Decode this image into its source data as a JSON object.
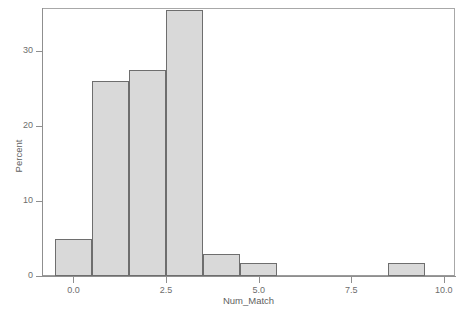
{
  "chart_data": {
    "type": "bar",
    "title": "",
    "xlabel": "Num_Match",
    "ylabel": "Percent",
    "categories": [
      "0",
      "1",
      "2",
      "3",
      "4",
      "5",
      "6",
      "7",
      "8",
      "9",
      "10"
    ],
    "bin_width": 1.0,
    "bin_edges": [
      -0.5,
      0.5,
      1.5,
      2.5,
      3.5,
      4.5,
      5.5,
      6.5,
      7.5,
      8.5,
      9.5,
      10.5
    ],
    "values": [
      5.0,
      26.0,
      27.5,
      35.5,
      3.0,
      1.7,
      0,
      0,
      0,
      1.7,
      0
    ],
    "xlim": [
      -0.85,
      10.3
    ],
    "ylim": [
      0,
      35.8
    ],
    "xticks": [
      0.0,
      2.5,
      5.0,
      7.5,
      10.0
    ],
    "xticklabels": [
      "0.0",
      "2.5",
      "5.0",
      "7.5",
      "10.0"
    ],
    "yticks": [
      0,
      10,
      20,
      30
    ],
    "yticklabels": [
      "0",
      "10",
      "20",
      "30"
    ],
    "grid": false,
    "legend": null,
    "bar_fill_color": "#d9d9d9",
    "bar_edge_color": "#6e6e6e",
    "axis_color": "#8f8f8f",
    "text_color": "#6d6d6d"
  }
}
